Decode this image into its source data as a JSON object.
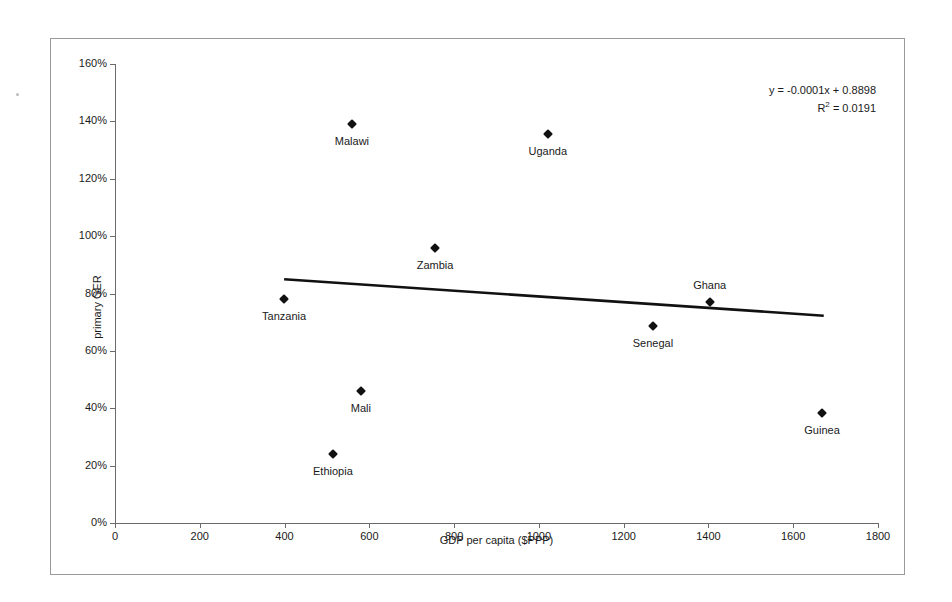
{
  "chart_data": {
    "type": "scatter",
    "title": "",
    "xlabel": "GDP per capita ($PPP)",
    "ylabel": "primary GER",
    "xlim": [
      0,
      1800
    ],
    "ylim": [
      0,
      1.6
    ],
    "grid": false,
    "legend": false,
    "xticks": [
      "0",
      "200",
      "400",
      "600",
      "800",
      "1000",
      "1200",
      "1400",
      "1600",
      "1800"
    ],
    "xtick_values": [
      0,
      200,
      400,
      600,
      800,
      1000,
      1200,
      1400,
      1600,
      1800
    ],
    "yticks": [
      "0%",
      "20%",
      "40%",
      "60%",
      "80%",
      "100%",
      "120%",
      "140%",
      "160%"
    ],
    "ytick_values": [
      0,
      0.2,
      0.4,
      0.6,
      0.8,
      1.0,
      1.2,
      1.4,
      1.6
    ],
    "points": [
      {
        "label": "Tanzania",
        "x": 399,
        "y": 0.78,
        "label_pos": "below"
      },
      {
        "label": "Ethiopia",
        "x": 514,
        "y": 0.24,
        "label_pos": "below"
      },
      {
        "label": "Malawi",
        "x": 559,
        "y": 1.39,
        "label_pos": "below"
      },
      {
        "label": "Mali",
        "x": 580,
        "y": 0.46,
        "label_pos": "below"
      },
      {
        "label": "Zambia",
        "x": 755,
        "y": 0.96,
        "label_pos": "below"
      },
      {
        "label": "Uganda",
        "x": 1021,
        "y": 1.355,
        "label_pos": "below"
      },
      {
        "label": "Senegal",
        "x": 1269,
        "y": 0.685,
        "label_pos": "below"
      },
      {
        "label": "Ghana",
        "x": 1403,
        "y": 0.77,
        "label_pos": "above"
      },
      {
        "label": "Guinea",
        "x": 1668,
        "y": 0.385,
        "label_pos": "below"
      }
    ],
    "trendline": {
      "equation": "y = -0.0001x + 0.8898",
      "r_squared_label": "R",
      "r_squared_exponent": "2",
      "r_squared_value": "= 0.0191",
      "slope": -0.0001,
      "intercept": 0.8898,
      "r_squared": 0.0191,
      "x_start": 399,
      "x_end": 1672
    },
    "colors": {
      "marker": "#111111",
      "trendline": "#111111",
      "axis": "#6b6b6b",
      "text": "#1a1a1a",
      "background": "#ffffff",
      "frame_border": "#9a9a9a"
    }
  }
}
